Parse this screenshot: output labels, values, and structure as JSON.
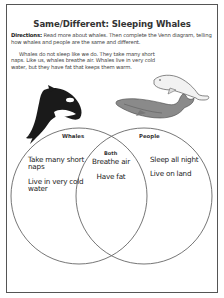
{
  "worksheet": {
    "title": "Same/Different: Sleeping Whales",
    "directions_label": "Directions:",
    "directions_text": " Read more about whales. Then complete the Venn diagram, telling how whales and people are the same and different.",
    "passage": "Whales do not sleep like we do. They take many short naps. Like us, whales breathe air. Whales live in very cold water, but they have fat that keeps them warm."
  },
  "illustrations": [
    {
      "name": "orca-whale",
      "description": "black and white killer whale"
    },
    {
      "name": "humpback-whale",
      "description": "gray humpback whale"
    },
    {
      "name": "beluga-whale",
      "description": "white beluga whale"
    }
  ],
  "venn": {
    "left": {
      "label": "Whales",
      "items": [
        "Take many short naps",
        "Live in very cold water"
      ]
    },
    "center": {
      "label": "Both",
      "items": [
        "Breathe air",
        "Have fat"
      ]
    },
    "right": {
      "label": "People",
      "items": [
        "Sleep all night",
        "Live on land"
      ]
    }
  }
}
